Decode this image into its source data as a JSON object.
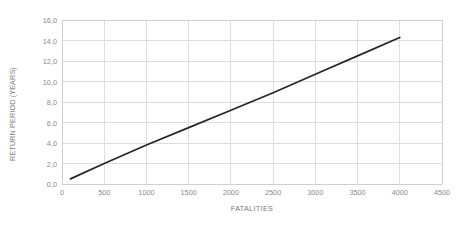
{
  "chart_data": {
    "type": "line",
    "title": "",
    "xlabel": "FATALITIES",
    "ylabel": "RETURN PERIOD (YEARS)",
    "xlim": [
      0,
      4500
    ],
    "ylim": [
      0,
      16
    ],
    "xticks": [
      0,
      500,
      1000,
      1500,
      2000,
      2500,
      3000,
      3500,
      4000,
      4500
    ],
    "xtick_labels": [
      "0",
      "500",
      "1000",
      "1500",
      "2000",
      "2500",
      "3000",
      "3500",
      "4000",
      "4500"
    ],
    "yticks": [
      0,
      2,
      4,
      6,
      8,
      10,
      12,
      14,
      16
    ],
    "ytick_labels": [
      "0,0",
      "2,0",
      "4,0",
      "6,0",
      "8,0",
      "10,0",
      "12,0",
      "14,0",
      "16,0"
    ],
    "grid": "both",
    "legend": "none",
    "decimal_separator": ",",
    "series": [
      {
        "name": "Return period",
        "color": "#262626",
        "line_width": 1.7,
        "x": [
          100,
          500,
          1000,
          1500,
          2000,
          2500,
          3000,
          3500,
          4000
        ],
        "y": [
          0.5,
          2.0,
          3.8,
          5.5,
          7.2,
          8.9,
          10.7,
          12.5,
          14.3
        ]
      }
    ],
    "colors": {
      "line": "#262626",
      "grid": "#dedede",
      "axis": "#cfcfcf",
      "tick_text": "#8a8a8a",
      "axis_title_text": "#7b7b7b",
      "background": "#ffffff"
    }
  }
}
